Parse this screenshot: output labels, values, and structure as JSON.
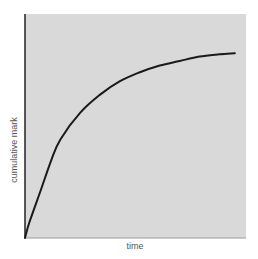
{
  "chart_data": {
    "type": "line",
    "title": "",
    "xlabel": "time",
    "ylabel": "cumulative mark",
    "xlim": [
      0,
      1
    ],
    "ylim": [
      0,
      1
    ],
    "grid": false,
    "legend": null,
    "ticks": {
      "x": [],
      "y": []
    },
    "series": [
      {
        "name": "cumulative mark",
        "x": [
          0.0,
          0.02,
          0.07,
          0.12,
          0.16,
          0.25,
          0.34,
          0.43,
          0.52,
          0.61,
          0.7,
          0.79,
          0.88,
          0.95
        ],
        "y": [
          0.0,
          0.07,
          0.21,
          0.35,
          0.44,
          0.56,
          0.64,
          0.7,
          0.74,
          0.77,
          0.79,
          0.81,
          0.82,
          0.825
        ]
      }
    ],
    "colors": {
      "plot_background": "#d9d9d9",
      "line": "#1a1a1a",
      "y_axis": "#222222",
      "x_axis": "#9a9a9a"
    }
  },
  "labels": {
    "x": "time",
    "y": "cumulative mark"
  }
}
